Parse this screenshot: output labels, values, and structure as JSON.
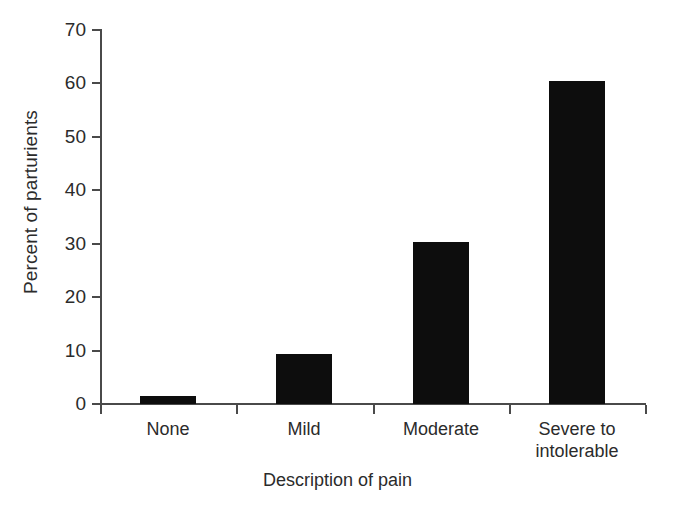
{
  "chart_data": {
    "type": "bar",
    "title": "",
    "categories": [
      "None",
      "Mild",
      "Moderate",
      "Severe to\nintolerable"
    ],
    "values": [
      1.5,
      9.3,
      30.4,
      60.4
    ],
    "xlabel": "Description of pain",
    "ylabel": "Percent of parturients",
    "ylim": [
      0,
      70
    ],
    "yticks": [
      0,
      10,
      20,
      30,
      40,
      50,
      60,
      70
    ],
    "ytick_labels": [
      "0",
      "10",
      "20",
      "30",
      "40",
      "50",
      "60",
      "70"
    ],
    "grid": false,
    "legend": false,
    "bar_color": "#0d0d0d",
    "axis_color": "#4a4a4a",
    "background": "#ffffff"
  },
  "axes": {
    "y_title": "Percent of parturients",
    "x_title": "Description of pain"
  }
}
